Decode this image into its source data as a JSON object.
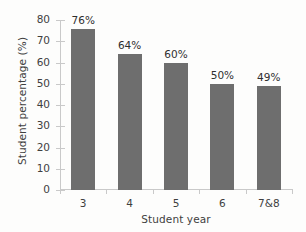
{
  "chart_data": {
    "type": "bar",
    "title": "",
    "xlabel": "Student year",
    "ylabel": "Student percentage (%)",
    "categories": [
      "3",
      "4",
      "5",
      "6",
      "7&8"
    ],
    "values": [
      76,
      64,
      60,
      50,
      49
    ],
    "data_labels": [
      "76%",
      "64%",
      "60%",
      "50%",
      "49%"
    ],
    "ylim": [
      0,
      80
    ],
    "y_ticks": [
      0,
      10,
      20,
      30,
      40,
      50,
      60,
      70,
      80
    ],
    "y_tick_labels": [
      "0",
      "10",
      "20",
      "30",
      "40",
      "50",
      "60",
      "70",
      "80"
    ],
    "grid": false,
    "legend": false,
    "legend_position": "none",
    "bar_color": "#6e6e6e",
    "axis_color": "#c9c9c9",
    "text_color": "#3f3f3f",
    "background_color": "#fdfdfc"
  }
}
